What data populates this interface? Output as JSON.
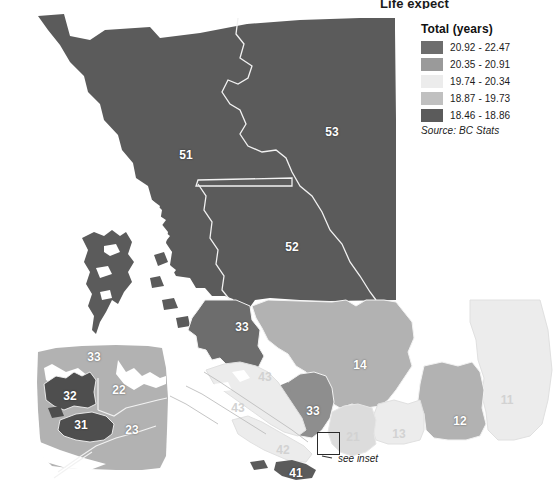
{
  "title": "Life expect",
  "legend": {
    "heading": "Total (years)",
    "source": "Source:  BC Stats",
    "classes": [
      {
        "label": "20.92 - 22.47",
        "color": "#6d6d6d"
      },
      {
        "label": "20.35 - 20.91",
        "color": "#9a9a9a"
      },
      {
        "label": "19.74 - 20.34",
        "color": "#ececec"
      },
      {
        "label": "18.87 - 19.73",
        "color": "#c0c0c0"
      },
      {
        "label": "18.46 - 18.86",
        "color": "#5b5b5b"
      }
    ]
  },
  "annotations": {
    "see_inset": "see inset"
  },
  "map_regions": [
    {
      "id": "51",
      "label": "51",
      "x": 186,
      "y": 155,
      "class": 4
    },
    {
      "id": "53",
      "label": "53",
      "x": 332,
      "y": 132,
      "class": 4
    },
    {
      "id": "52",
      "label": "52",
      "x": 292,
      "y": 247,
      "class": 4
    },
    {
      "id": "33n",
      "label": "33",
      "x": 242,
      "y": 327,
      "class": 0
    },
    {
      "id": "14",
      "label": "14",
      "x": 360,
      "y": 365,
      "class": 1
    },
    {
      "id": "11",
      "label": "11",
      "x": 507,
      "y": 400,
      "class": 2
    },
    {
      "id": "12",
      "label": "12",
      "x": 460,
      "y": 421,
      "class": 1
    },
    {
      "id": "13",
      "label": "13",
      "x": 399,
      "y": 434,
      "class": 2
    },
    {
      "id": "21",
      "label": "21",
      "x": 353,
      "y": 437,
      "class": 2
    },
    {
      "id": "33s",
      "label": "33",
      "x": 313,
      "y": 411,
      "class": 0
    },
    {
      "id": "43n",
      "label": "43",
      "x": 265,
      "y": 377,
      "class": 2
    },
    {
      "id": "43s",
      "label": "43",
      "x": 238,
      "y": 408,
      "class": 2
    },
    {
      "id": "42",
      "label": "42",
      "x": 283,
      "y": 450,
      "class": 2
    },
    {
      "id": "41",
      "label": "41",
      "x": 296,
      "y": 473,
      "class": 4
    }
  ],
  "inset_regions": [
    {
      "id": "i33",
      "label": "33",
      "x": 94,
      "y": 357,
      "class": 1
    },
    {
      "id": "i22",
      "label": "22",
      "x": 119,
      "y": 390,
      "class": 1
    },
    {
      "id": "i32",
      "label": "32",
      "x": 70,
      "y": 396,
      "class": 4
    },
    {
      "id": "i31",
      "label": "31",
      "x": 81,
      "y": 425,
      "class": 4
    },
    {
      "id": "i23",
      "label": "23",
      "x": 132,
      "y": 430,
      "class": 1
    }
  ]
}
